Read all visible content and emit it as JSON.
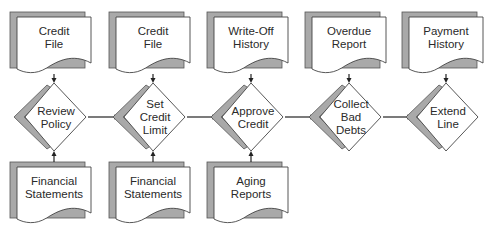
{
  "diagram": {
    "colors": {
      "shadow": "#a9a9a9",
      "outline": "#444444",
      "text": "#2a2a2a",
      "background": "#ffffff"
    },
    "columns": [
      {
        "x": 52,
        "input_top": [
          "Credit",
          "File"
        ],
        "process": [
          "Review",
          "Policy"
        ],
        "input_bottom": [
          "Financial",
          "Statements"
        ]
      },
      {
        "x": 151,
        "input_top": [
          "Credit",
          "File"
        ],
        "process": [
          "Set",
          "Credit",
          "Limit"
        ],
        "input_bottom": [
          "Financial",
          "Statements"
        ]
      },
      {
        "x": 249,
        "input_top": [
          "Write-Off",
          "History"
        ],
        "process": [
          "Approve",
          "Credit"
        ],
        "input_bottom": [
          "Aging",
          "Reports"
        ]
      },
      {
        "x": 347,
        "input_top": [
          "Overdue",
          "Report"
        ],
        "process": [
          "Collect",
          "Bad",
          "Debts"
        ],
        "input_bottom": null
      },
      {
        "x": 444,
        "input_top": [
          "Payment",
          "History"
        ],
        "process": [
          "Extend",
          "Line"
        ],
        "input_bottom": null
      }
    ],
    "flow": [
      "Review Policy",
      "Set Credit Limit",
      "Approve Credit",
      "Collect Bad Debts",
      "Extend Line"
    ]
  }
}
